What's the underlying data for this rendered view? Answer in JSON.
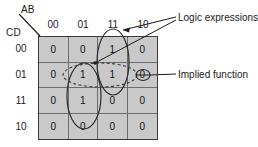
{
  "diagram": {
    "axis": {
      "top_label": "AB",
      "left_label": "CD",
      "column_headers": [
        "00",
        "01",
        "11",
        "10"
      ],
      "row_headers": [
        "00",
        "01",
        "11",
        "10"
      ]
    },
    "cell_fill_color": "#c9c9c9",
    "grid_line_color": "#6d6d6d",
    "border_color": "#3a3a3a",
    "ink_color": "#1a1a1a",
    "cells": [
      [
        "0",
        "0",
        "1",
        "0"
      ],
      [
        "0",
        "1",
        "1",
        "0"
      ],
      [
        "0",
        "1",
        "0",
        "0"
      ],
      [
        "0",
        "0",
        "0",
        "0"
      ]
    ],
    "annotations": [
      {
        "id": "logic-expressions",
        "label": "Logic expressions"
      },
      {
        "id": "implied-function",
        "label": "Implied function"
      }
    ],
    "groupings": [
      {
        "id": "group-col01-vertical",
        "style": "solid",
        "shape": "ellipse"
      },
      {
        "id": "group-col11-vertical",
        "style": "solid",
        "shape": "ellipse"
      },
      {
        "id": "group-row01-horizontal",
        "style": "dashed",
        "shape": "ellipse"
      },
      {
        "id": "group-implied-cell",
        "style": "solid",
        "shape": "small-ellipse"
      }
    ]
  }
}
